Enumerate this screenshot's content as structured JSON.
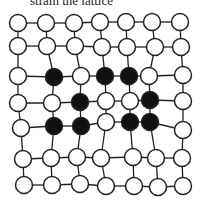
{
  "caption": "strain the lattice",
  "colors": {
    "filled": "#111111",
    "empty": "#ffffff",
    "stroke": "#222222"
  },
  "lattice": {
    "rows": 7,
    "cols": 7,
    "states": [
      [
        "empty",
        "empty",
        "empty",
        "empty",
        "empty",
        "empty",
        "empty"
      ],
      [
        "empty",
        "empty",
        "empty",
        "empty",
        "empty",
        "empty",
        "empty"
      ],
      [
        "empty",
        "filled",
        "empty",
        "filled",
        "filled",
        "empty",
        "empty"
      ],
      [
        "empty",
        "empty",
        "filled",
        "empty",
        "empty",
        "filled",
        "empty"
      ],
      [
        "empty",
        "filled",
        "filled",
        "empty",
        "filled",
        "filled",
        "empty"
      ],
      [
        "empty",
        "empty",
        "empty",
        "empty",
        "empty",
        "empty",
        "empty"
      ],
      [
        "empty",
        "empty",
        "empty",
        "empty",
        "empty",
        "empty",
        "empty"
      ]
    ]
  }
}
